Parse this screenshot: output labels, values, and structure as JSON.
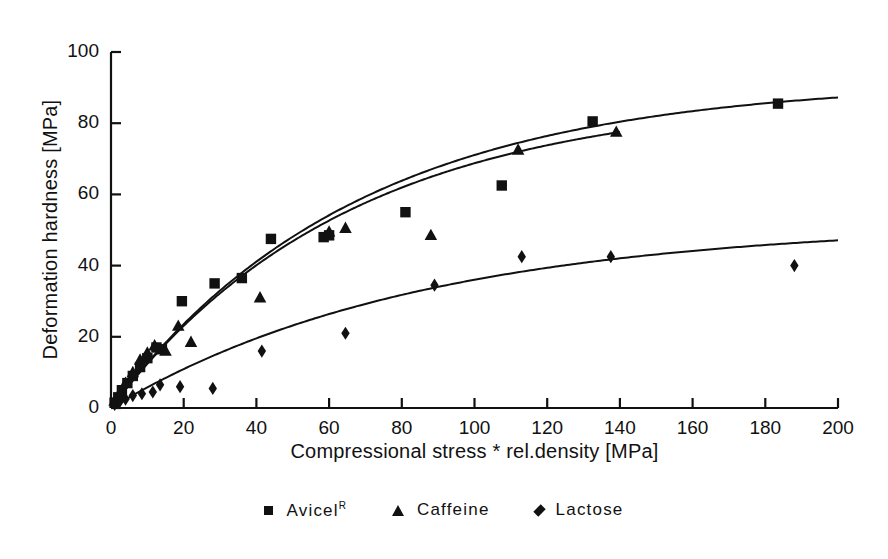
{
  "chart_data": {
    "type": "scatter",
    "title": "",
    "xlabel": "Compressional stress * rel.density [MPa]",
    "ylabel": "Deformation hardness [MPa]",
    "xlim": [
      0,
      200
    ],
    "ylim": [
      0,
      100
    ],
    "xticks": [
      0,
      20,
      40,
      60,
      80,
      100,
      120,
      140,
      160,
      180,
      200
    ],
    "yticks": [
      0,
      20,
      40,
      60,
      80,
      100
    ],
    "grid": false,
    "legend_position": "bottom-center",
    "series": [
      {
        "name": "Avicel",
        "name_sup": "R",
        "marker": "square",
        "color": "#111111",
        "points": [
          [
            1.0,
            1.5
          ],
          [
            2.0,
            3.0
          ],
          [
            3.0,
            5.0
          ],
          [
            4.5,
            7.0
          ],
          [
            6.0,
            9.0
          ],
          [
            8.0,
            11.5
          ],
          [
            10.0,
            14.0
          ],
          [
            12.5,
            17.0
          ],
          [
            14.0,
            16.5
          ],
          [
            19.5,
            30.0
          ],
          [
            28.5,
            35.0
          ],
          [
            36.0,
            36.5
          ],
          [
            44.0,
            47.5
          ],
          [
            58.5,
            48.0
          ],
          [
            60.0,
            48.5
          ],
          [
            81.0,
            55.0
          ],
          [
            107.5,
            62.5
          ],
          [
            132.5,
            80.5
          ],
          [
            183.5,
            85.5
          ]
        ],
        "fit_curve": {
          "model": "saturating",
          "hmax": 92.0,
          "k": 0.0148,
          "x_range": [
            0,
            200
          ]
        }
      },
      {
        "name": "Caffeine",
        "marker": "triangle",
        "color": "#111111",
        "points": [
          [
            1.0,
            2.0
          ],
          [
            2.5,
            4.5
          ],
          [
            4.0,
            7.0
          ],
          [
            6.0,
            10.0
          ],
          [
            8.0,
            13.5
          ],
          [
            10.0,
            15.5
          ],
          [
            12.0,
            17.5
          ],
          [
            15.0,
            16.0
          ],
          [
            18.5,
            23.0
          ],
          [
            22.0,
            18.5
          ],
          [
            41.0,
            31.0
          ],
          [
            60.0,
            49.5
          ],
          [
            64.5,
            50.5
          ],
          [
            88.0,
            48.5
          ],
          [
            112.0,
            72.5
          ],
          [
            139.0,
            77.5
          ]
        ],
        "fit_curve": {
          "model": "saturating",
          "hmax": 88.0,
          "k": 0.0152,
          "x_range": [
            0,
            140
          ]
        }
      },
      {
        "name": "Lactose",
        "marker": "diamond",
        "color": "#111111",
        "points": [
          [
            1.0,
            1.0
          ],
          [
            2.5,
            2.0
          ],
          [
            4.0,
            2.5
          ],
          [
            6.0,
            3.5
          ],
          [
            8.5,
            4.0
          ],
          [
            11.5,
            4.5
          ],
          [
            13.5,
            6.5
          ],
          [
            19.0,
            6.0
          ],
          [
            28.0,
            5.5
          ],
          [
            41.5,
            16.0
          ],
          [
            64.5,
            21.0
          ],
          [
            89.0,
            34.5
          ],
          [
            113.0,
            42.5
          ],
          [
            137.5,
            42.5
          ],
          [
            188.0,
            40.0
          ]
        ],
        "fit_curve": {
          "model": "saturating",
          "hmax": 52.0,
          "k": 0.0118,
          "x_range": [
            0,
            200
          ]
        }
      }
    ]
  },
  "axes": {
    "ylabel": "Deformation hardness [MPa]",
    "xlabel": "Compressional stress * rel.density [MPa]",
    "ytick_labels": [
      "100",
      "80",
      "60",
      "40",
      "20",
      "0"
    ],
    "xtick_labels": [
      "0",
      "20",
      "40",
      "60",
      "80",
      "100",
      "120",
      "140",
      "160",
      "180",
      "200"
    ]
  },
  "legend": {
    "items": [
      {
        "label": "Avicel",
        "sup": "R",
        "marker": "square-marker"
      },
      {
        "label": "Caffeine",
        "sup": "",
        "marker": "triangle-marker"
      },
      {
        "label": "Lactose",
        "sup": "",
        "marker": "diamond-marker"
      }
    ]
  }
}
